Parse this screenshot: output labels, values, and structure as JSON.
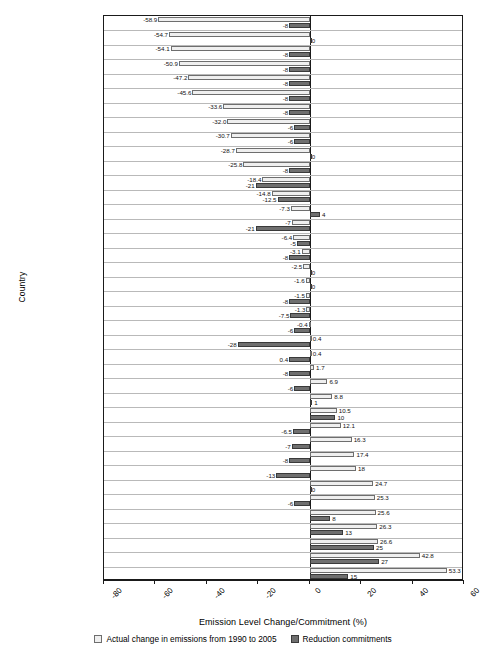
{
  "chart_data": {
    "type": "bar",
    "orientation": "horizontal",
    "title": "",
    "xlabel": "Emission Level Change/Commitment (%)",
    "ylabel": "Country",
    "xlim": [
      -80,
      60
    ],
    "xticks": [
      -80,
      -60,
      -40,
      -20,
      0,
      20,
      40,
      60
    ],
    "xticklabels": [
      "-80",
      "-60",
      "-40",
      "-20",
      "0",
      "20",
      "40",
      "60"
    ],
    "grid": true,
    "legend_position": "bottom",
    "categories": [
      "Latvia",
      "Ukraine",
      "Lithuania",
      "Estonia",
      "Bulgaria",
      "Romania",
      "Slovakia",
      "Poland",
      "Hungary",
      "Russia",
      "Czech Republic",
      "Germany",
      "United Kingdom",
      "Sweden",
      "Denmark",
      "Croatia",
      "Monaco",
      "Finland",
      "France",
      "EU in its entirety",
      "Belgium",
      "The Netherlands",
      "Luxemburg",
      "Slovenia",
      "Switzerland",
      "Japan",
      "Norway",
      "Iceland",
      "Italy",
      "USA",
      "Liechtenstein",
      "Austria",
      "New Zealand",
      "Canada",
      "Australia",
      "Ireland",
      "Greece",
      "Portugal",
      "Spain"
    ],
    "series": [
      {
        "name": "Actual change in emissions from 1990 to 2005",
        "color": "#efefef",
        "values": [
          -58.9,
          -54.7,
          -54.1,
          -50.9,
          -47.2,
          -45.6,
          -33.6,
          -32.0,
          -30.7,
          -28.7,
          -25.8,
          -18.4,
          -14.8,
          -7.3,
          -7,
          -6.4,
          -3.1,
          -2.5,
          -1.6,
          -1.5,
          -1.3,
          -0.4,
          0.4,
          0.4,
          1.7,
          6.9,
          8.8,
          10.5,
          12.1,
          16.3,
          17.4,
          18,
          24.7,
          25.3,
          25.6,
          26.3,
          26.6,
          42.8,
          53.3
        ],
        "labels": [
          "-58.9",
          "-54.7",
          "-54.1",
          "-50.9",
          "-47.2",
          "-45.6",
          "-33.6",
          "-32.0",
          "-30.7",
          "-28.7",
          "-25.8",
          "-18.4",
          "-14.8",
          "-7.3",
          "-7",
          "-6.4",
          "-3.1",
          "-2.5",
          "-1.6",
          "-1.5",
          "-1.3",
          "-0.4",
          "0.4",
          "0.4",
          "1.7",
          "6.9",
          "8.8",
          "10.5",
          "12.1",
          "16.3",
          "17.4",
          "18",
          "24.7",
          "25.3",
          "25.6",
          "26.3",
          "26.6",
          "42.8",
          "53.3"
        ]
      },
      {
        "name": "Reduction commitments",
        "color": "#6f6f6f",
        "values": [
          -8,
          0,
          -8,
          -8,
          -8,
          -8,
          -8,
          -6,
          -6,
          0,
          -8,
          -21,
          -12.5,
          4,
          -21,
          -5,
          -8,
          0,
          0,
          -8,
          -7.5,
          -6,
          -28,
          -8,
          -8,
          -6,
          1,
          10,
          -6.5,
          -7,
          -8,
          -13,
          0,
          -6,
          8,
          13,
          25,
          27,
          15
        ],
        "labels": [
          "-8",
          "0",
          "-8",
          "-8",
          "-8",
          "-8",
          "-8",
          "-6",
          "-6",
          "0",
          "-8",
          "-21",
          "-12.5",
          "4",
          "-21",
          "-5",
          "-8",
          "0",
          "0",
          "-8",
          "-7.5",
          "-6",
          "-28",
          "0.4",
          "-8",
          "-6",
          "1",
          "10",
          "-6.5",
          "-7",
          "-8",
          "-13",
          "0",
          "-6",
          "8",
          "13",
          "25",
          "27",
          "15"
        ]
      }
    ],
    "legend": [
      "Actual change in emissions from 1990 to 2005",
      "Reduction commitments"
    ]
  }
}
